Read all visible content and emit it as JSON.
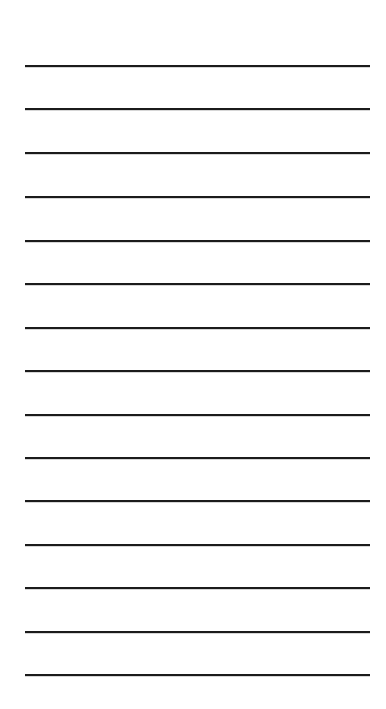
{
  "document": {
    "kind": "lined-paper",
    "title": "Blank lined paper",
    "background_color": "#ffffff",
    "page_width": 386,
    "page_height": 709,
    "content_text": "",
    "has_text_content": false
  },
  "rules": {
    "count": 15,
    "color": "#1b1b1b",
    "thickness_px": 2,
    "left_x": 25,
    "right_x": 370,
    "length_px": 345,
    "spacing_px": 43.5,
    "first_line_y": 65,
    "last_line_y": 674,
    "top_margin_px": 65,
    "bottom_margin_px": 35,
    "left_margin_px": 25,
    "right_margin_px": 16,
    "line_positions_y": [
      65,
      108,
      152,
      196,
      240,
      283,
      327,
      370,
      414,
      457,
      500,
      544,
      587,
      631,
      674
    ]
  }
}
